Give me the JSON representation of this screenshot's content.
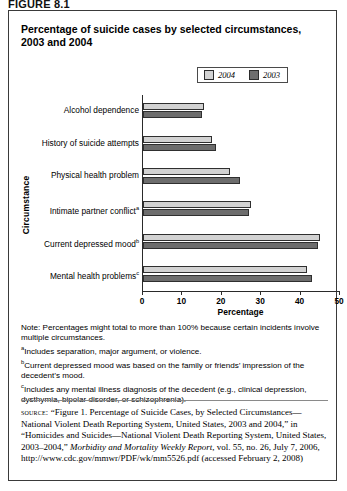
{
  "figure_label": "FIGURE 8.1",
  "title": "Percentage of suicide cases by selected circumstances, 2003 and 2004",
  "legend": {
    "items": [
      {
        "label": "2004",
        "color": "#d2d2d2"
      },
      {
        "label": "2003",
        "color": "#6d6d6d"
      }
    ]
  },
  "axes": {
    "ylabel": "Circumstance",
    "xlabel": "Percentage",
    "xticks": [
      "0",
      "10",
      "20",
      "30",
      "40",
      "50"
    ]
  },
  "notes": {
    "note": "Note: Percentages might total to more than 100% because certain incidents involve multiple circumstances.",
    "a": "Includes separation, major argument, or violence.",
    "b": "Current depressed mood was based on the family or friends’ impression of the decedent’s mood.",
    "c": "Includes any mental illness diagnosis of the decedent (e.g., clinical depression, dysthymia, bipolar disorder, or schizophrenia).",
    "marker_a": "a",
    "marker_b": "b",
    "marker_c": "c"
  },
  "source": {
    "label": "source:",
    "text": " “Figure 1. Percentage of Suicide Cases, by Selected Circumstances—National Violent Death Reporting System, United States, 2003 and 2004,” in “Homicides and Suicides—National Violent Death Reporting System, United States, 2003–2004,” ",
    "italic1": "Morbidity and Mortality Weekly Report",
    "text2": ", vol. 55, no. 26, July 7, 2006, http://www.cdc.gov/mmwr/PDF/wk/mm5526.pdf (accessed February 2, 2008)"
  },
  "chart_data": {
    "type": "bar",
    "orientation": "horizontal",
    "title": "Percentage of suicide cases by selected circumstances, 2003 and 2004",
    "xlabel": "Percentage",
    "ylabel": "Circumstance",
    "xlim": [
      0,
      50
    ],
    "xticks": [
      0,
      10,
      20,
      30,
      40,
      50
    ],
    "grid": false,
    "legend_position": "top-right",
    "categories": [
      "Alcohol dependence",
      "History of suicide attempts",
      "Physical health problem",
      "Intimate partner conflict",
      "Current depressed mood",
      "Mental health problems"
    ],
    "category_footnotes": [
      "",
      "",
      "",
      "a",
      "b",
      "c"
    ],
    "series": [
      {
        "name": "2004",
        "color": "#d2d2d2",
        "values": [
          15.5,
          17.5,
          22,
          27.5,
          45,
          41.5
        ]
      },
      {
        "name": "2003",
        "color": "#6d6d6d",
        "values": [
          15,
          18.5,
          24.5,
          27,
          44.5,
          43
        ]
      }
    ]
  }
}
